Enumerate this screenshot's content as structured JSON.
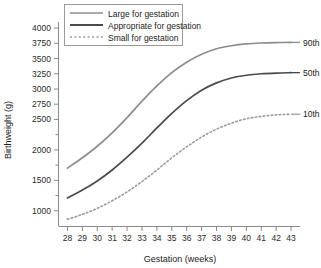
{
  "chart_data": {
    "type": "line",
    "title": "",
    "xlabel": "Gestation (weeks)",
    "ylabel": "Birthweight (g)",
    "xlim": [
      27.4,
      43.6
    ],
    "ylim": [
      750,
      4100
    ],
    "grid": false,
    "legend_position": "top-center",
    "x": [
      28,
      29,
      30,
      31,
      32,
      33,
      34,
      35,
      36,
      37,
      38,
      39,
      40,
      41,
      42,
      43
    ],
    "xticks": [
      28,
      29,
      30,
      31,
      32,
      33,
      34,
      35,
      36,
      37,
      38,
      39,
      40,
      41,
      42,
      43
    ],
    "yticks_labeled": [
      1000,
      1500,
      2000,
      2500,
      2750,
      3000,
      3250,
      3500,
      3750,
      4000
    ],
    "yticks_minor": [
      1250,
      1750,
      2250
    ],
    "ytick_labels": [
      "1000",
      "1500",
      "2000",
      "2500",
      "2750",
      "3000",
      "3250",
      "3500",
      "3750",
      "4000"
    ],
    "series": [
      {
        "name": "Large for gestation",
        "legend_label": "Large for gestation",
        "end_label": "90th",
        "style": "solid",
        "color": "#8d8d8d",
        "values": [
          1700,
          1870,
          2060,
          2280,
          2530,
          2800,
          3050,
          3270,
          3440,
          3570,
          3660,
          3710,
          3740,
          3755,
          3762,
          3765
        ]
      },
      {
        "name": "Appropriate for gestation",
        "legend_label": "Appropriate for gestation",
        "end_label": "50th",
        "style": "solid",
        "color": "#4a4a4a",
        "values": [
          1210,
          1340,
          1490,
          1670,
          1880,
          2110,
          2360,
          2600,
          2810,
          2980,
          3100,
          3180,
          3225,
          3250,
          3262,
          3268
        ]
      },
      {
        "name": "Small for gestation",
        "legend_label": "Small for gestation",
        "end_label": "10th",
        "style": "dotted",
        "color": "#9b9b9b",
        "values": [
          860,
          940,
          1040,
          1165,
          1310,
          1480,
          1670,
          1870,
          2050,
          2210,
          2340,
          2440,
          2510,
          2550,
          2575,
          2585
        ]
      }
    ]
  },
  "legend": {
    "items": [
      {
        "label": "Large for gestation"
      },
      {
        "label": "Appropriate for gestation"
      },
      {
        "label": "Small for gestation"
      }
    ]
  }
}
